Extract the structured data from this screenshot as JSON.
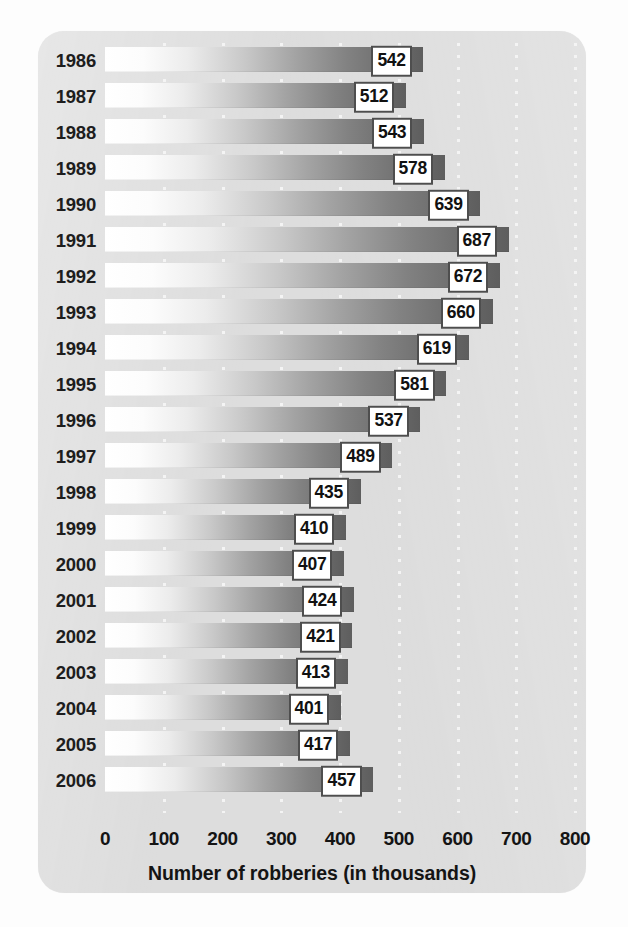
{
  "chart_data": {
    "type": "bar",
    "orientation": "horizontal",
    "title": "",
    "xlabel": "Number of robberies (in thousands)",
    "ylabel": "",
    "xlim": [
      0,
      800
    ],
    "xticks": [
      0,
      100,
      200,
      300,
      400,
      500,
      600,
      700,
      800
    ],
    "xtick_labels": [
      "0",
      "100",
      "200",
      "300",
      "400",
      "500",
      "600",
      "700",
      "800"
    ],
    "grid": "vertical-dotted",
    "legend": null,
    "categories": [
      "1986",
      "1987",
      "1988",
      "1989",
      "1990",
      "1991",
      "1992",
      "1993",
      "1994",
      "1995",
      "1996",
      "1997",
      "1998",
      "1999",
      "2000",
      "2001",
      "2002",
      "2003",
      "2004",
      "2005",
      "2006"
    ],
    "values": [
      542,
      512,
      543,
      578,
      639,
      687,
      672,
      660,
      619,
      581,
      537,
      489,
      435,
      410,
      407,
      424,
      421,
      413,
      401,
      417,
      457
    ],
    "data_labels": [
      "542",
      "512",
      "543",
      "578",
      "639",
      "687",
      "672",
      "660",
      "619",
      "581",
      "537",
      "489",
      "435",
      "410",
      "407",
      "424",
      "421",
      "413",
      "401",
      "417",
      "457"
    ],
    "bars": [
      {
        "category": "1986",
        "value": 542,
        "label": "542"
      },
      {
        "category": "1987",
        "value": 512,
        "label": "512"
      },
      {
        "category": "1988",
        "value": 543,
        "label": "543"
      },
      {
        "category": "1989",
        "value": 578,
        "label": "578"
      },
      {
        "category": "1990",
        "value": 639,
        "label": "639"
      },
      {
        "category": "1991",
        "value": 687,
        "label": "687"
      },
      {
        "category": "1992",
        "value": 672,
        "label": "672"
      },
      {
        "category": "1993",
        "value": 660,
        "label": "660"
      },
      {
        "category": "1994",
        "value": 619,
        "label": "619"
      },
      {
        "category": "1995",
        "value": 581,
        "label": "581"
      },
      {
        "category": "1996",
        "value": 537,
        "label": "537"
      },
      {
        "category": "1997",
        "value": 489,
        "label": "489"
      },
      {
        "category": "1998",
        "value": 435,
        "label": "435"
      },
      {
        "category": "1999",
        "value": 410,
        "label": "410"
      },
      {
        "category": "2000",
        "value": 407,
        "label": "407"
      },
      {
        "category": "2001",
        "value": 424,
        "label": "424"
      },
      {
        "category": "2002",
        "value": 421,
        "label": "421"
      },
      {
        "category": "2003",
        "value": 413,
        "label": "413"
      },
      {
        "category": "2004",
        "value": 401,
        "label": "401"
      },
      {
        "category": "2005",
        "value": 417,
        "label": "417"
      },
      {
        "category": "2006",
        "value": 457,
        "label": "457"
      }
    ]
  },
  "colors": {
    "panel_background": "#dddddd",
    "page_background": "#fdfdfd",
    "bar_gradient_start": "#ffffff",
    "bar_gradient_end": "#5e5e5e",
    "value_box_fill": "#ffffff",
    "value_box_border": "#4e4e4e",
    "text": "#141414",
    "gridline": "#f4f4f4"
  }
}
